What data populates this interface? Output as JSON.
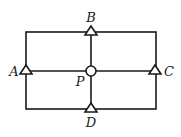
{
  "diagram": {
    "type": "rectangular circuit / network with nodes",
    "stroke_color": "#1a1a1a",
    "background": "#ffffff",
    "rectangle": {
      "x1": 26,
      "y1": 32,
      "x2": 156,
      "y2": 109
    },
    "center": {
      "x": 91,
      "y": 71
    },
    "nodes": [
      {
        "id": "B",
        "label": "B",
        "shape": "triangle",
        "x": 91,
        "y": 32,
        "label_x": 91,
        "label_y": 22
      },
      {
        "id": "A",
        "label": "A",
        "shape": "triangle",
        "x": 26,
        "y": 71,
        "label_x": 13,
        "label_y": 76
      },
      {
        "id": "P",
        "label": "P",
        "shape": "circle",
        "x": 91,
        "y": 71,
        "label_x": 80,
        "label_y": 86
      },
      {
        "id": "C",
        "label": "C",
        "shape": "triangle",
        "x": 155,
        "y": 71,
        "label_x": 169,
        "label_y": 76
      },
      {
        "id": "D",
        "label": "D",
        "shape": "triangle",
        "x": 91,
        "y": 109,
        "label_x": 91,
        "label_y": 127
      }
    ]
  }
}
